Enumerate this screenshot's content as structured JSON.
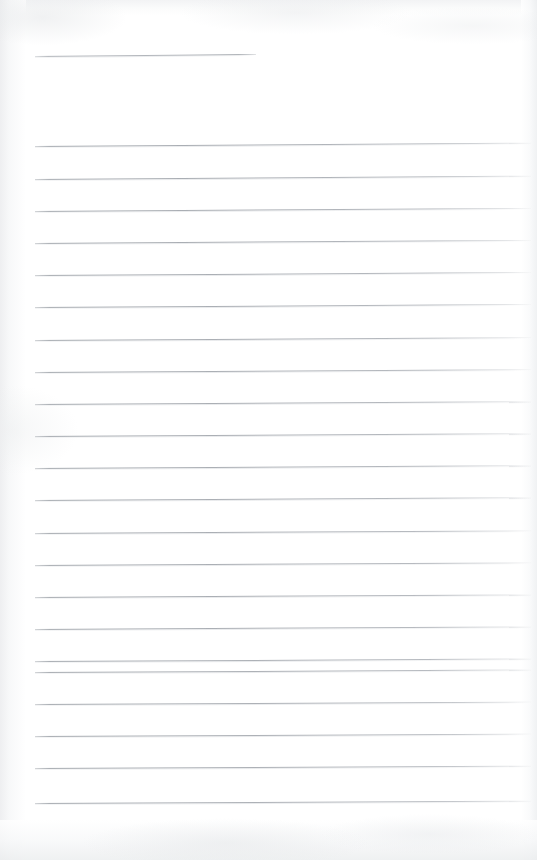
{
  "document": {
    "kind": "scanned-lined-notebook-page",
    "title": "Blank ruled notebook page",
    "page_width": 537,
    "page_height": 860,
    "background_color": "#ffffff",
    "rule_color": "#a8acb2",
    "rule_thickness_px": 1,
    "content_text": "",
    "has_handwriting": false,
    "scan_artifacts": {
      "left_edge_shadow": true,
      "right_edge_shadow": true,
      "top_edge_shadow": true,
      "bottom_edge_shadow": true,
      "page_skew_degrees": -0.35
    }
  },
  "header_rule": {
    "label": "header-rule",
    "x_start": 35,
    "x_end": 256,
    "y": 56,
    "skew_degrees": -0.5
  },
  "ruled_lines": [
    {
      "index": 1,
      "y": 146,
      "x_start": 35,
      "x_end": 531,
      "skew_degrees": -0.38
    },
    {
      "index": 2,
      "y": 179,
      "x_start": 35,
      "x_end": 531,
      "skew_degrees": -0.38
    },
    {
      "index": 3,
      "y": 211,
      "x_start": 35,
      "x_end": 531,
      "skew_degrees": -0.36
    },
    {
      "index": 4,
      "y": 243,
      "x_start": 35,
      "x_end": 531,
      "skew_degrees": -0.36
    },
    {
      "index": 5,
      "y": 275,
      "x_start": 35,
      "x_end": 531,
      "skew_degrees": -0.35
    },
    {
      "index": 6,
      "y": 307,
      "x_start": 35,
      "x_end": 531,
      "skew_degrees": -0.35
    },
    {
      "index": 7,
      "y": 340,
      "x_start": 35,
      "x_end": 531,
      "skew_degrees": -0.34
    },
    {
      "index": 8,
      "y": 372,
      "x_start": 35,
      "x_end": 531,
      "skew_degrees": -0.34
    },
    {
      "index": 9,
      "y": 404,
      "x_start": 35,
      "x_end": 531,
      "skew_degrees": -0.33
    },
    {
      "index": 10,
      "y": 436,
      "x_start": 35,
      "x_end": 531,
      "skew_degrees": -0.33
    },
    {
      "index": 11,
      "y": 468,
      "x_start": 35,
      "x_end": 531,
      "skew_degrees": -0.32
    },
    {
      "index": 12,
      "y": 500,
      "x_start": 35,
      "x_end": 531,
      "skew_degrees": -0.32
    },
    {
      "index": 13,
      "y": 533,
      "x_start": 35,
      "x_end": 531,
      "skew_degrees": -0.31
    },
    {
      "index": 14,
      "y": 565,
      "x_start": 35,
      "x_end": 531,
      "skew_degrees": -0.31
    },
    {
      "index": 15,
      "y": 597,
      "x_start": 35,
      "x_end": 531,
      "skew_degrees": -0.3
    },
    {
      "index": 16,
      "y": 629,
      "x_start": 35,
      "x_end": 531,
      "skew_degrees": -0.3
    },
    {
      "index": 17,
      "y": 661,
      "x_start": 35,
      "x_end": 531,
      "skew_degrees": -0.29
    },
    {
      "index": 18,
      "y": 672,
      "x_start": 35,
      "x_end": 531,
      "skew_degrees": -0.29
    },
    {
      "index": 19,
      "y": 704,
      "x_start": 35,
      "x_end": 531,
      "skew_degrees": -0.28
    },
    {
      "index": 20,
      "y": 736,
      "x_start": 35,
      "x_end": 531,
      "skew_degrees": -0.28
    },
    {
      "index": 21,
      "y": 768,
      "x_start": 35,
      "x_end": 531,
      "skew_degrees": -0.27
    },
    {
      "index": 22,
      "y": 803,
      "x_start": 35,
      "x_end": 531,
      "skew_degrees": -0.27
    }
  ]
}
